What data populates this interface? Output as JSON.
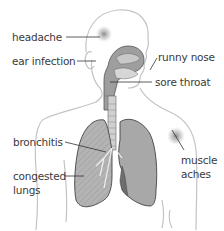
{
  "diagram": {
    "colors": {
      "outline": "#bdbdbd",
      "organ_fill": "#a9a9a9",
      "organ_dark": "#7a7a7a",
      "leader": "#333333",
      "text": "#3a3a3a",
      "pain_spot": "#8e8e8e"
    },
    "labels": {
      "headache": "headache",
      "ear_infection": "ear infection",
      "runny_nose": "runny nose",
      "sore_throat": "sore throat",
      "bronchitis": "bronchitis",
      "muscle_aches_1": "muscle",
      "muscle_aches_2": "aches",
      "congested_lungs_1": "congested",
      "congested_lungs_2": "lungs"
    }
  }
}
